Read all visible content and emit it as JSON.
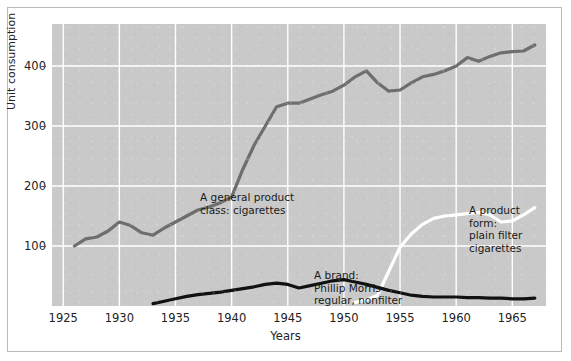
{
  "figure": {
    "background_color": "#ffffff",
    "plot_background_color": "#c9c9c9",
    "frame_color": "#b9b9b9"
  },
  "chart_data": {
    "type": "line",
    "title": "",
    "subtitle": "",
    "xlabel": "Years",
    "ylabel": "Unit consumption",
    "xlim": [
      1924,
      1968
    ],
    "ylim": [
      0,
      470
    ],
    "grid": true,
    "grid_color": "#ffffff",
    "legend_position": "inline-annotations",
    "xticks": [
      1925,
      1930,
      1935,
      1940,
      1945,
      1950,
      1955,
      1960,
      1965
    ],
    "xtick_labels": [
      "1925",
      "1930",
      "1935",
      "1940",
      "1945",
      "1950",
      "1955",
      "1960",
      "1965"
    ],
    "yticks": [
      100,
      200,
      300,
      400
    ],
    "ytick_labels": [
      "100",
      "200",
      "300",
      "400"
    ],
    "series": [
      {
        "name": "A general product class: cigarettes",
        "color": "#6e6e6e",
        "line_width": 3.2,
        "x": [
          1926,
          1927,
          1928,
          1929,
          1930,
          1931,
          1932,
          1933,
          1934,
          1935,
          1936,
          1937,
          1938,
          1939,
          1940,
          1941,
          1942,
          1943,
          1944,
          1945,
          1946,
          1947,
          1948,
          1949,
          1950,
          1951,
          1952,
          1953,
          1954,
          1955,
          1956,
          1957,
          1958,
          1959,
          1960,
          1961,
          1962,
          1963,
          1964,
          1965,
          1966,
          1967
        ],
        "values": [
          100,
          112,
          115,
          125,
          140,
          134,
          122,
          118,
          130,
          140,
          150,
          160,
          165,
          172,
          182,
          228,
          268,
          300,
          332,
          338,
          338,
          345,
          352,
          358,
          368,
          382,
          392,
          372,
          358,
          360,
          372,
          382,
          386,
          392,
          400,
          414,
          408,
          416,
          422,
          424,
          425,
          435
        ]
      },
      {
        "name": "A product form: plain filter cigarettes",
        "color": "#ffffff",
        "line_width": 3.2,
        "x": [
          1951,
          1952,
          1953,
          1954,
          1955,
          1956,
          1957,
          1958,
          1959,
          1960,
          1961,
          1962,
          1963,
          1964,
          1965,
          1966,
          1967
        ],
        "values": [
          6,
          10,
          18,
          58,
          98,
          120,
          136,
          146,
          150,
          152,
          154,
          156,
          152,
          140,
          142,
          152,
          164
        ]
      },
      {
        "name": "A brand: Phillip Morris regular, nonfilter",
        "color": "#111111",
        "line_width": 3.2,
        "x": [
          1933,
          1934,
          1935,
          1936,
          1937,
          1938,
          1939,
          1940,
          1941,
          1942,
          1943,
          1944,
          1945,
          1946,
          1947,
          1948,
          1949,
          1950,
          1951,
          1952,
          1953,
          1954,
          1955,
          1956,
          1957,
          1958,
          1959,
          1960,
          1961,
          1962,
          1963,
          1964,
          1965,
          1966,
          1967
        ],
        "values": [
          4,
          8,
          12,
          16,
          19,
          21,
          23,
          26,
          29,
          32,
          36,
          38,
          36,
          30,
          34,
          38,
          42,
          44,
          40,
          36,
          31,
          26,
          22,
          18,
          16,
          15,
          15,
          15,
          14,
          14,
          13,
          13,
          12,
          12,
          13
        ]
      }
    ],
    "annotations": [
      {
        "id": "class",
        "text": "A general product\nclass: cigarettes",
        "color": "#1a1a1a"
      },
      {
        "id": "brand",
        "text": "A brand:\nPhillip Morris\nregular, nonfilter",
        "color": "#1a1a1a"
      },
      {
        "id": "form",
        "text": "A product form:\nplain filter\ncigarettes",
        "color": "#1a1a1a"
      }
    ]
  }
}
